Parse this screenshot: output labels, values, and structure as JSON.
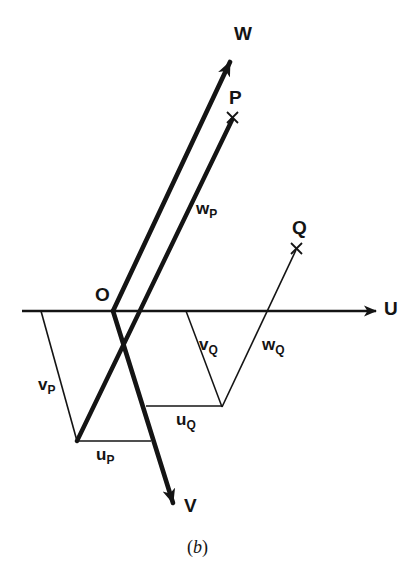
{
  "figure": {
    "caption_open": "(",
    "caption_letter": "b",
    "caption_close": ")",
    "caption_full": "(b)",
    "background_color": "#ffffff",
    "ink_color": "#141414"
  },
  "axes": [
    {
      "name": "U",
      "label": "U",
      "description": "horizontal axis pointing right"
    },
    {
      "name": "V",
      "label": "V",
      "description": "axis pointing down-right, heavy line"
    },
    {
      "name": "W",
      "label": "W",
      "description": "axis pointing up-right, heavy line"
    }
  ],
  "origin": {
    "label": "O"
  },
  "points": [
    {
      "name": "P",
      "label": "P",
      "marker": "x-marker"
    },
    {
      "name": "Q",
      "label": "Q",
      "marker": "x-marker"
    }
  ],
  "components": [
    {
      "name": "u_P",
      "base": "u",
      "sub": "P",
      "text": "u"
    },
    {
      "name": "v_P",
      "base": "v",
      "sub": "P",
      "text": "v"
    },
    {
      "name": "w_P",
      "base": "w",
      "sub": "P",
      "text": "w"
    },
    {
      "name": "u_Q",
      "base": "u",
      "sub": "Q",
      "text": "u"
    },
    {
      "name": "v_Q",
      "base": "v",
      "sub": "Q",
      "text": "v"
    },
    {
      "name": "w_Q",
      "base": "w",
      "sub": "Q",
      "text": "w"
    }
  ],
  "labels": {
    "axis_u": "U",
    "axis_v": "V",
    "axis_w": "W",
    "origin": "O",
    "point_p": "P",
    "point_q": "Q",
    "u_p_base": "u",
    "u_p_sub": "P",
    "v_p_base": "v",
    "v_p_sub": "P",
    "w_p_base": "w",
    "w_p_sub": "P",
    "u_q_base": "u",
    "u_q_sub": "Q",
    "v_q_base": "v",
    "v_q_sub": "Q",
    "w_q_base": "w",
    "w_q_sub": "Q"
  }
}
